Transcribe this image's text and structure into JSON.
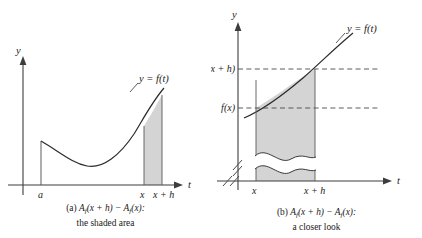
{
  "figure": {
    "panels": [
      {
        "id": "a",
        "axis_y_label": "y",
        "axis_t_label": "t",
        "curve_label": "y = f(t)",
        "tick_labels": [
          "a",
          "x",
          "x + h"
        ],
        "caption_line1_prefix": "(a) ",
        "caption_line1_A1": "A",
        "caption_line1_sub1": "f",
        "caption_line1_mid": "(x + h) − ",
        "caption_line1_A2": "A",
        "caption_line1_sub2": "f",
        "caption_line1_end": "(x):",
        "caption_line2": "the shaded area"
      },
      {
        "id": "b",
        "axis_y_label": "y",
        "axis_t_label": "t",
        "curve_label": "y = f(t)",
        "tick_labels": [
          "x",
          "x + h"
        ],
        "value_labels": [
          "f(x + h)",
          "f(x)"
        ],
        "caption_line1_prefix": "(b) ",
        "caption_line1_A1": "A",
        "caption_line1_sub1": "f",
        "caption_line1_mid": "(x + h) − ",
        "caption_line1_A2": "A",
        "caption_line1_sub2": "f",
        "caption_line1_end": "(x):",
        "caption_line2": "a closer look"
      }
    ],
    "colors": {
      "shade": "#d4d4d4",
      "stroke": "#2b2b2b",
      "axis": "#3d3d3d",
      "background": "#ffffff"
    }
  }
}
